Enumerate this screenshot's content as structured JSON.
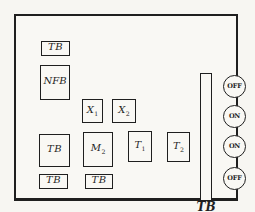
{
  "panel": {
    "blocks": [
      {
        "base": "TB",
        "sub": ""
      },
      {
        "base": "NFB",
        "sub": ""
      },
      {
        "base": "X",
        "sub": "1"
      },
      {
        "base": "X",
        "sub": "2"
      },
      {
        "base": "TB",
        "sub": ""
      },
      {
        "base": "M",
        "sub": "2"
      },
      {
        "base": "T",
        "sub": "1"
      },
      {
        "base": "T",
        "sub": "2"
      },
      {
        "base": "TB",
        "sub": ""
      },
      {
        "base": "TB",
        "sub": ""
      }
    ],
    "terminal_strip": {
      "label": "TB"
    },
    "buttons": [
      {
        "label": "OFF"
      },
      {
        "label": "ON"
      },
      {
        "label": "ON"
      },
      {
        "label": "OFF"
      }
    ]
  },
  "colors": {
    "ink": "#1f1f1f",
    "paper": "#f7f6f2"
  }
}
